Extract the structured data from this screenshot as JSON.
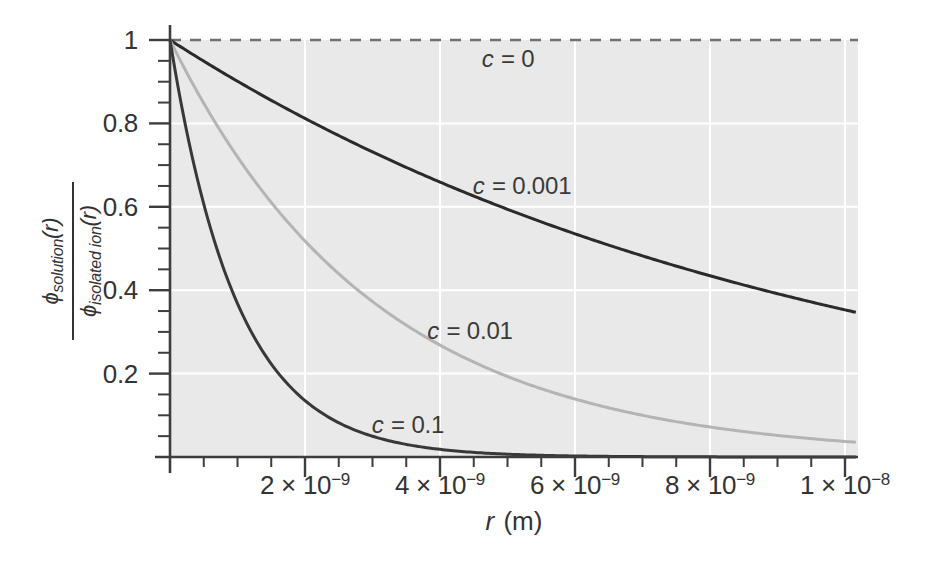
{
  "chart_data": {
    "type": "line",
    "title": "",
    "xlabel": "r (m)",
    "ylabel": "ϕ_solution(r) / ϕ_isolated ion(r)",
    "xlim_m": [
      0,
      1.02e-08
    ],
    "ylim": [
      0,
      1.04
    ],
    "grid": true,
    "legend_position": "inline-annotations",
    "generator_hint": "value = exp(-r_nm / lambda_nm); lambda is the Debye screening length per concentration",
    "x_axis": {
      "unit": "m",
      "major_ticks_nm": [
        2,
        4,
        6,
        8,
        10
      ],
      "minor_step_nm": 0.5,
      "tick_labels": [
        {
          "base": "2 × 10",
          "exp": "−9"
        },
        {
          "base": "4 × 10",
          "exp": "−9"
        },
        {
          "base": "6 × 10",
          "exp": "−9"
        },
        {
          "base": "8 × 10",
          "exp": "−9"
        },
        {
          "base": "1 × 10",
          "exp": "−8"
        }
      ]
    },
    "y_axis": {
      "major_ticks": [
        1,
        0.8,
        0.6,
        0.4,
        0.2
      ],
      "tick_labels": [
        "1",
        "0.8",
        "0.6",
        "0.4",
        "0.2"
      ],
      "minor_step": 0.05
    },
    "x_nm": [
      0,
      0.5,
      1,
      1.5,
      2,
      2.5,
      3,
      3.5,
      4,
      4.5,
      5,
      5.5,
      6,
      6.5,
      7,
      7.5,
      8,
      8.5,
      9,
      9.5,
      10
    ],
    "series": [
      {
        "id": "c-0",
        "label": "c = 0",
        "lambda_nm": null,
        "style": "dashed",
        "color": "#6f6f6f",
        "width": 2.5,
        "values": [
          1,
          1,
          1,
          1,
          1,
          1,
          1,
          1,
          1,
          1,
          1,
          1,
          1,
          1,
          1,
          1,
          1,
          1,
          1,
          1,
          1
        ]
      },
      {
        "id": "c-0001",
        "label": "c = 0.001",
        "lambda_nm": 9.6,
        "style": "solid",
        "color": "#2a2a2a",
        "width": 3,
        "values": [
          1,
          0.949,
          0.901,
          0.855,
          0.812,
          0.771,
          0.732,
          0.694,
          0.659,
          0.626,
          0.594,
          0.564,
          0.535,
          0.508,
          0.482,
          0.458,
          0.435,
          0.412,
          0.392,
          0.372,
          0.353
        ]
      },
      {
        "id": "c-001",
        "label": "c = 0.01",
        "lambda_nm": 3.04,
        "style": "solid",
        "color": "#b4b4b4",
        "width": 3,
        "values": [
          1,
          0.848,
          0.72,
          0.611,
          0.518,
          0.44,
          0.373,
          0.316,
          0.268,
          0.228,
          0.193,
          0.164,
          0.139,
          0.118,
          0.1,
          0.085,
          0.072,
          0.061,
          0.052,
          0.044,
          0.037
        ]
      },
      {
        "id": "c-01",
        "label": "c = 0.1",
        "lambda_nm": 1.0,
        "style": "solid",
        "color": "#383838",
        "width": 3,
        "values": [
          1,
          0.607,
          0.368,
          0.223,
          0.135,
          0.082,
          0.05,
          0.03,
          0.018,
          0.011,
          0.007,
          0.004,
          0.002,
          0.002,
          0.001,
          0.001,
          0.0,
          0.0,
          0.0,
          0.0,
          0.0
        ]
      }
    ],
    "annotations": [
      {
        "for": "c-0",
        "italic": "c",
        "text": " = 0",
        "x_px": 508,
        "y_px": 59
      },
      {
        "for": "c-0001",
        "italic": "c",
        "text": " = 0.001",
        "x_px": 522,
        "y_px": 186
      },
      {
        "for": "c-001",
        "italic": "c",
        "text": " = 0.01",
        "x_px": 470,
        "y_px": 331
      },
      {
        "for": "c-01",
        "italic": "c",
        "text": " = 0.1",
        "x_px": 408,
        "y_px": 425
      }
    ],
    "axis_labels": {
      "x_italic": "r",
      "x_rest": " (m)",
      "y_numerator_phi": "ϕ",
      "y_numerator_sub": "solution",
      "y_numerator_arg": "(r)",
      "y_denominator_phi": "ϕ",
      "y_denominator_sub": "isolated ion",
      "y_denominator_arg": "(r)"
    },
    "colors": {
      "page_background": "#ffffff",
      "plot_background": "#e9e9e9",
      "grid": "#ffffff",
      "axis": "#3d3d3d",
      "text": "#333333"
    }
  }
}
